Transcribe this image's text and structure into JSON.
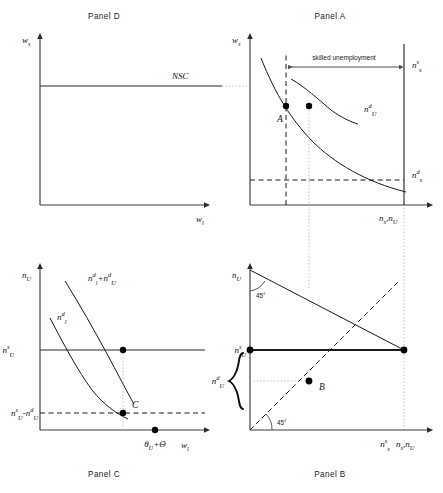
{
  "figure": {
    "type": "diagram",
    "panels": {
      "D": {
        "title": "Panel  D",
        "y_axis_label": "w",
        "y_axis_sub": "s",
        "x_axis_label": "w",
        "x_axis_sub": "l",
        "curve_label": "NSC",
        "curve_type": "horizontal-line"
      },
      "A": {
        "title": "Panel  A",
        "y_axis_label": "w",
        "y_axis_sub": "s",
        "x_axis_label_1": "n",
        "x_axis_sub_1": "s",
        "x_axis_sep": ",",
        "x_axis_label_2": "n",
        "x_axis_sub_2": "U",
        "annotation": "skilled unemployment",
        "supply_label": "n",
        "supply_sub": "s",
        "supply_sup": "s",
        "demand_unskilled_label": "n",
        "demand_unskilled_sub": "U",
        "demand_unskilled_sup": "d",
        "demand_skilled_label": "n",
        "demand_skilled_sub": "s",
        "demand_skilled_sup": "d",
        "point_label": "A"
      },
      "C": {
        "title": "Panel C",
        "y_axis_label": "n",
        "y_axis_sub": "U",
        "x_axis_label": "w",
        "x_axis_sub": "l",
        "sum_curve_label_1": "n",
        "sum_curve_sub_1": "l",
        "sum_curve_sup_1": "d",
        "sum_curve_plus": "+",
        "sum_curve_label_2": "n",
        "sum_curve_sub_2": "U",
        "sum_curve_sup_2": "d",
        "low_curve_label": "n",
        "low_curve_sub": "l",
        "low_curve_sup": "d",
        "y_tick_upper": "n",
        "y_tick_upper_sub": "U",
        "y_tick_upper_sup": "s",
        "y_tick_lower_1": "n",
        "y_tick_lower_sub_1": "U",
        "y_tick_lower_sup_1": "s",
        "y_tick_lower_minus": "-",
        "y_tick_lower_2": "n",
        "y_tick_lower_sub_2": "U",
        "y_tick_lower_sup_2": "d",
        "x_tick_theta": "θ",
        "x_tick_theta_sub": "U",
        "x_tick_plus": "+",
        "x_tick_bigtheta": "Θ",
        "point_label": "C"
      },
      "B": {
        "title": "Panel B",
        "y_axis_label": "n",
        "y_axis_sub": "U",
        "y_tick_label": "n",
        "y_tick_sub": "U",
        "y_tick_sup": "s",
        "brace_label": "n",
        "brace_sub": "U",
        "brace_sup": "d",
        "angle_top": "45°",
        "angle_bottom": "45°",
        "x_tick_label": "n",
        "x_tick_sub": "s",
        "x_tick_sup": "s",
        "x_axis_label_1": "n",
        "x_axis_sub_1": "s",
        "x_axis_sep": ",",
        "x_axis_label_2": "n",
        "x_axis_sub_2": "U",
        "point_label": "B"
      }
    },
    "colors": {
      "stroke": "#1a1a1a",
      "axis": "#3c3c3c",
      "guide": "#b4b4b4",
      "background": "#ffffff"
    }
  }
}
